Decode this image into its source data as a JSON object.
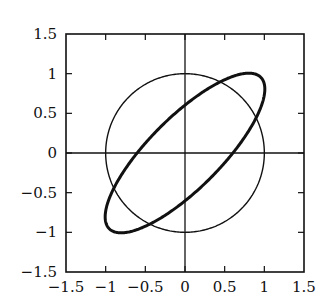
{
  "chart_data": {
    "type": "line",
    "title": "",
    "xlabel": "",
    "ylabel": "",
    "xlim": [
      -1.5,
      1.5
    ],
    "ylim": [
      -1.5,
      1.5
    ],
    "grid": false,
    "legend": null,
    "x_ticks": [
      "−1.5",
      "−1",
      "−0.5",
      "0",
      "0.5",
      "1",
      "1.5"
    ],
    "y_ticks": [
      "1.5",
      "1",
      "0.5",
      "0",
      "−0.5",
      "−1",
      "−1.5"
    ],
    "series": [
      {
        "name": "unit circle",
        "shape": "circle",
        "center": [
          0,
          0
        ],
        "radius": 1,
        "stroke": "thin",
        "color": "#111111"
      },
      {
        "name": "tilted ellipse",
        "shape": "ellipse",
        "center": [
          0,
          0
        ],
        "angle_deg": 45,
        "semi_major": 1.35,
        "semi_minor": 0.45,
        "stroke": "thick",
        "color": "#111111"
      }
    ],
    "axes_lines": {
      "x_axis_at_y0": true,
      "y_axis_at_x0": true
    }
  }
}
